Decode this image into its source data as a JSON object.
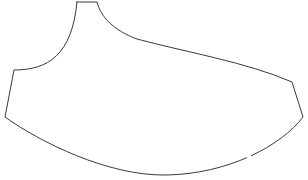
{
  "canvas": {
    "width": 308,
    "height": 180,
    "background_color": "#ffffff",
    "label": "line-drawing-canvas"
  },
  "drawing": {
    "title": "",
    "kind": "closed-outline-contour",
    "description": "single closed freehand outline resembling a pattern piece with a narrow flat-topped neck at upper left-of-center, a concave shoulder curve down to a left corner, a long gently convex top-right edge, an angled right side, and a wide smooth concave bottom sweep",
    "stroke_color": "#3a3a3a",
    "stroke_width": 1,
    "fill_color": "none",
    "segments": [
      {
        "name": "neck-top-flat",
        "type": "line",
        "from": [
          77,
          2
        ],
        "to": [
          97,
          2
        ]
      },
      {
        "name": "neck-right-shoulder-curve",
        "type": "cubic",
        "from": [
          97,
          2
        ],
        "c1": [
          101,
          17
        ],
        "c2": [
          113,
          30
        ],
        "to": [
          137,
          39
        ]
      },
      {
        "name": "upper-right-long-edge",
        "type": "cubic",
        "from": [
          137,
          39
        ],
        "c1": [
          185,
          52
        ],
        "c2": [
          246,
          62
        ],
        "to": [
          292,
          82
        ]
      },
      {
        "name": "right-side-edge",
        "type": "line",
        "from": [
          292,
          82
        ],
        "to": [
          303,
          117
        ]
      },
      {
        "name": "bottom-right-sweep",
        "type": "cubic",
        "from": [
          303,
          117
        ],
        "c1": [
          281,
          146
        ],
        "c2": [
          228,
          174
        ],
        "to": [
          166,
          175
        ]
      },
      {
        "name": "bottom-left-sweep",
        "type": "cubic",
        "from": [
          166,
          175
        ],
        "c1": [
          108,
          176
        ],
        "c2": [
          40,
          142
        ],
        "to": [
          5,
          117
        ]
      },
      {
        "name": "left-side-edge",
        "type": "line",
        "from": [
          5,
          117
        ],
        "to": [
          14,
          70
        ]
      },
      {
        "name": "left-shoulder-concave-curve",
        "type": "cubic",
        "from": [
          14,
          70
        ],
        "c1": [
          48,
          70
        ],
        "c2": [
          72,
          55
        ],
        "to": [
          77,
          2
        ]
      }
    ],
    "path_d": "M 77 2 L 97 2 C 101 17 113 30 137 39 C 185 52 246 62 292 82 L 303 117 C 281 146 228 174 166 175 C 108 176 40 142 5 117 L 14 70 C 48 70 72 55 77 2 Z",
    "gaps": [
      {
        "name": "bottom-left-gap",
        "at": [
          86,
          157
        ],
        "length": 3
      },
      {
        "name": "bottom-right-gap",
        "at": [
          248,
          156
        ],
        "length": 3
      }
    ],
    "vertices": [
      {
        "name": "neck-top-left-corner",
        "x": 77,
        "y": 2
      },
      {
        "name": "neck-top-right-corner",
        "x": 97,
        "y": 2
      },
      {
        "name": "left-shoulder-corner",
        "x": 14,
        "y": 70
      },
      {
        "name": "right-upper-corner",
        "x": 292,
        "y": 82
      },
      {
        "name": "left-lower-corner",
        "x": 5,
        "y": 117
      },
      {
        "name": "right-lower-corner",
        "x": 303,
        "y": 117
      },
      {
        "name": "bottom-apex",
        "x": 166,
        "y": 175
      }
    ]
  }
}
